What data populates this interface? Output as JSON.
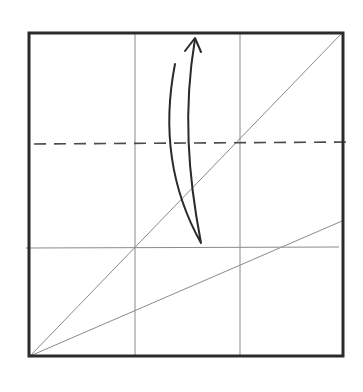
{
  "diagram": {
    "type": "origami-fold-step",
    "colors": {
      "background": "#ffffff",
      "paper_border": "#2b2b2b",
      "crease": "#8a8a8a",
      "fold_line": "#4a4a4a",
      "arrow": "#2a2a2a"
    },
    "paper": {
      "x1": 29,
      "y1": 33,
      "x2": 343,
      "y2": 356
    },
    "creases": [
      {
        "name": "vertical-crease-left",
        "x1": 135,
        "y1": 33,
        "x2": 135,
        "y2": 356
      },
      {
        "name": "vertical-crease-right",
        "x1": 240,
        "y1": 33,
        "x2": 240,
        "y2": 356
      },
      {
        "name": "horizontal-crease-lower",
        "x1": 26,
        "y1": 248,
        "x2": 339,
        "y2": 247
      },
      {
        "name": "main-diagonal-crease",
        "x1": 30,
        "y1": 356,
        "x2": 342,
        "y2": 33
      },
      {
        "name": "shallow-diagonal-crease",
        "x1": 30,
        "y1": 356,
        "x2": 342,
        "y2": 221
      }
    ],
    "valley_fold": {
      "name": "valley-fold-line",
      "x1": 34,
      "y1": 144,
      "x2": 349,
      "y2": 142,
      "dash": "12,8"
    },
    "fold_arrow": {
      "name": "fold-up-arrow",
      "path": "M175,64 C166,110 163,175 201,243 C188,175 183,110 195,39",
      "head": "M185,51 L195,38 L201,52"
    }
  }
}
